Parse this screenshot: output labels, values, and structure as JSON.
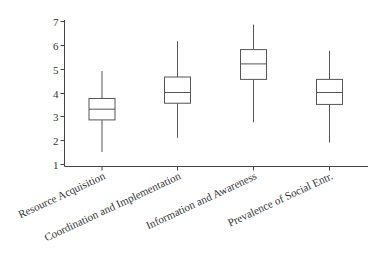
{
  "chart_data": {
    "type": "box",
    "title": "",
    "xlabel": "",
    "ylabel": "",
    "ylim": [
      1,
      7
    ],
    "yticks": [
      1,
      2,
      3,
      4,
      5,
      6,
      7
    ],
    "grid": false,
    "legend": null,
    "categories": [
      "Resource Acquisition",
      "Coordination and Implementation",
      "Information and Awareness",
      "Prevalence of Social Entr."
    ],
    "boxes": [
      {
        "category": "Resource Acquisition",
        "whisker_low": 1.5,
        "q1": 2.85,
        "median": 3.3,
        "q3": 3.75,
        "whisker_high": 4.9
      },
      {
        "category": "Coordination and Implementation",
        "whisker_low": 2.1,
        "q1": 3.55,
        "median": 4.0,
        "q3": 4.65,
        "whisker_high": 6.15
      },
      {
        "category": "Information and Awareness",
        "whisker_low": 2.75,
        "q1": 4.55,
        "median": 5.2,
        "q3": 5.8,
        "whisker_high": 6.85
      },
      {
        "category": "Prevalence of Social Entr.",
        "whisker_low": 1.9,
        "q1": 3.5,
        "median": 4.0,
        "q3": 4.55,
        "whisker_high": 5.75
      }
    ]
  },
  "style": {
    "line_color": "#555555",
    "axis_color": "#444444",
    "box_fill": "#ffffff"
  }
}
